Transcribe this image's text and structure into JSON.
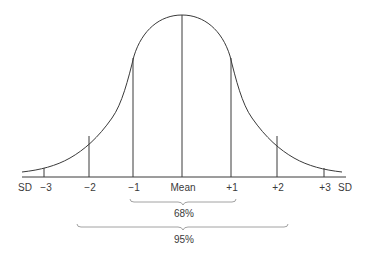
{
  "diagram": {
    "title": "",
    "axis": {
      "unit_left": "SD",
      "unit_right": "SD",
      "ticks": [
        {
          "label": "−3",
          "x": 44
        },
        {
          "label": "−2",
          "x": 89
        },
        {
          "label": "−1",
          "x": 133
        },
        {
          "label": "Mean",
          "x": 182
        },
        {
          "label": "+1",
          "x": 231
        },
        {
          "label": "+2",
          "x": 277
        },
        {
          "label": "+3",
          "x": 324
        }
      ]
    },
    "brackets": [
      {
        "label": "68%",
        "from": "−1",
        "to": "+1"
      },
      {
        "label": "95%",
        "from": "−2",
        "to": "+2"
      }
    ],
    "colors": {
      "line": "#3a3a3a",
      "bracket": "#8a8a8a"
    }
  }
}
